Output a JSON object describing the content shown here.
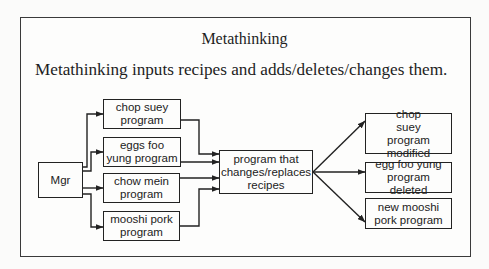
{
  "title": "Metathinking",
  "subtitle": "Metathinking inputs recipes and adds/deletes/changes them.",
  "diagram": {
    "manager": {
      "label": "Mgr"
    },
    "input_programs": [
      {
        "label": "chop suey program"
      },
      {
        "label": "eggs foo yung program"
      },
      {
        "label": "chow mein program"
      },
      {
        "label": "mooshi pork program"
      }
    ],
    "processor": {
      "label": "program that changes/replaces recipes"
    },
    "outputs": [
      {
        "label": "chop suey program modified"
      },
      {
        "label": "egg foo yung program deleted"
      },
      {
        "label": "new mooshi pork program"
      }
    ],
    "line_color": "#222222"
  }
}
